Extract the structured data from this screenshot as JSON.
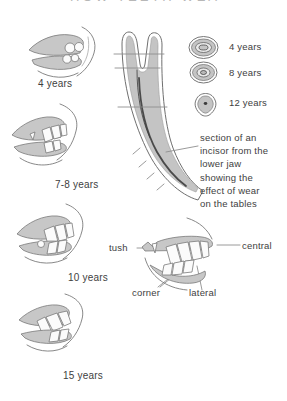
{
  "page": {
    "heading_partial": "HOW TEETH WEAR"
  },
  "colors": {
    "ink": "#7a7a7a",
    "shade": "#c7c7c7",
    "text": "#3e3e3e"
  },
  "left_column": {
    "items": [
      {
        "label": "4 years"
      },
      {
        "label": "7-8 years"
      },
      {
        "label": "10 years"
      },
      {
        "label": "15 years"
      }
    ]
  },
  "tables_legend": {
    "items": [
      {
        "label": "4 years"
      },
      {
        "label": "8 years"
      },
      {
        "label": "12 years"
      }
    ]
  },
  "incisor_section": {
    "caption": "section of an\nincisor from the\nlower jaw\nshowing the\neffect of wear\non the tables"
  },
  "incisor_names": {
    "tush": "tush",
    "central": "central",
    "corner": "corner",
    "lateral": "lateral"
  }
}
